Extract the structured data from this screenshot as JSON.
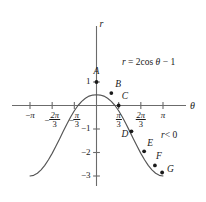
{
  "figure": {
    "background_color": "#ffffff",
    "ink_color": "#1a1a1a",
    "curve_color": "#555555",
    "axis_color": "#6b6b6b",
    "width": 206,
    "height": 202
  },
  "axes": {
    "x_axis_label": "θ",
    "y_axis_label": "r"
  },
  "annotations": {
    "equation_r": "r",
    "equation_eq": "= 2cos",
    "equation_theta": "θ",
    "equation_tail": "− 1",
    "inequality_r": "r",
    "inequality_tail": "< 0"
  },
  "x_ticks": [
    {
      "id": "neg-pi",
      "value": -3.14159,
      "minus": "−",
      "whole": "π",
      "num": "",
      "den": "",
      "fraction": false
    },
    {
      "id": "neg-2pi-3",
      "value": -2.0944,
      "minus": "−",
      "whole": "",
      "num": "2π",
      "den": "3",
      "fraction": true
    },
    {
      "id": "neg-pi-3",
      "value": -1.0472,
      "minus": "−",
      "whole": "",
      "num": "π",
      "den": "3",
      "fraction": true
    },
    {
      "id": "pos-pi-3",
      "value": 1.0472,
      "minus": "",
      "whole": "",
      "num": "π",
      "den": "3",
      "fraction": true
    },
    {
      "id": "pos-2pi-3",
      "value": 2.0944,
      "minus": "",
      "whole": "",
      "num": "2π",
      "den": "3",
      "fraction": true
    },
    {
      "id": "pos-pi",
      "value": 3.14159,
      "minus": "",
      "whole": "π",
      "num": "",
      "den": "",
      "fraction": false
    }
  ],
  "y_ticks": [
    {
      "id": "y-1",
      "value": 1,
      "label": "1"
    },
    {
      "id": "y-m1",
      "value": -1,
      "label": "−1"
    },
    {
      "id": "y-m2",
      "value": -2,
      "label": "−2"
    },
    {
      "id": "y-m3",
      "value": -3,
      "label": "−3"
    }
  ],
  "chart_data": {
    "type": "line",
    "title": "",
    "subtitle": "",
    "xlabel": "θ",
    "ylabel": "r",
    "equation": "r = 2cos θ − 1",
    "grid": false,
    "legend": "none",
    "xlim": [
      -3.665,
      3.665
    ],
    "ylim": [
      -3.35,
      1.6
    ],
    "xtick_values": [
      -3.14159,
      -2.0944,
      -1.0472,
      1.0472,
      2.0944,
      3.14159
    ],
    "xtick_labels": [
      "−π",
      "−2π/3",
      "−π/3",
      "π/3",
      "2π/3",
      "π"
    ],
    "ytick_values": [
      1,
      -1,
      -2,
      -3
    ],
    "ytick_labels": [
      "1",
      "−1",
      "−2",
      "−3"
    ],
    "series": [
      {
        "name": "r = 2cos θ − 1",
        "x": [
          -3.14159,
          -2.96706,
          -2.79253,
          -2.61799,
          -2.44346,
          -2.26893,
          -2.0944,
          -1.91986,
          -1.74533,
          -1.5708,
          -1.39626,
          -1.22173,
          -1.0472,
          -0.87266,
          -0.69813,
          -0.5236,
          -0.34907,
          -0.17453,
          0,
          0.17453,
          0.34907,
          0.5236,
          0.69813,
          0.87266,
          1.0472,
          1.22173,
          1.39626,
          1.5708,
          1.74533,
          1.91986,
          2.0944,
          2.26893,
          2.44346,
          2.61799,
          2.79253,
          2.96706,
          3.14159
        ],
        "y": [
          -3.0,
          -2.9708,
          -2.8836,
          -2.7411,
          -2.5479,
          -2.3105,
          -2.0372,
          -1.7374,
          -1.4216,
          -1.1009,
          -0.7871,
          -0.4916,
          -0.2251,
          0.0,
          0.1754,
          0.3094,
          0.3995,
          0.4444,
          0.4584,
          0.4444,
          0.3995,
          0.3094,
          0.1754,
          0.0,
          -0.2251,
          -0.4916,
          -0.7871,
          -1.1009,
          -1.4216,
          -1.7374,
          -2.0372,
          -2.3105,
          -2.5479,
          -2.7411,
          -2.8836,
          -2.9708,
          -3.0
        ]
      }
    ],
    "marked_points": [
      {
        "label": "A",
        "theta": 0.0,
        "r": 1.0,
        "label_dx": -3,
        "label_dy": -9
      },
      {
        "label": "B",
        "theta": 0.7,
        "r": 0.53,
        "label_dx": 4,
        "label_dy": -7
      },
      {
        "label": "C",
        "theta": 1.0472,
        "r": 0.0,
        "label_dx": 3,
        "label_dy": -8
      },
      {
        "label": "D",
        "theta": 1.65,
        "r": -1.1,
        "label_dx": -10,
        "label_dy": 5
      },
      {
        "label": "E",
        "theta": 2.25,
        "r": -1.95,
        "label_dx": 3,
        "label_dy": -6
      },
      {
        "label": "F",
        "theta": 2.76,
        "r": -2.55,
        "label_dx": 1,
        "label_dy": -7
      },
      {
        "label": "G",
        "theta": 3.1,
        "r": -2.85,
        "label_dx": 5,
        "label_dy": -1
      }
    ]
  }
}
